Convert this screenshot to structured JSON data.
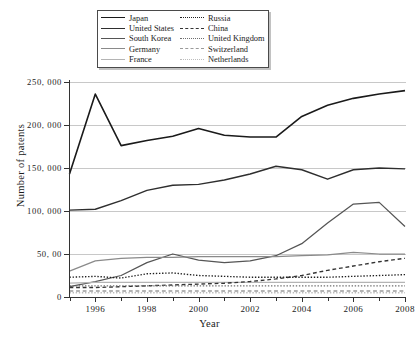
{
  "axes": {
    "ylabel": "Number of patents",
    "xlabel": "Year",
    "ytick_labels": [
      "0",
      "50, 00",
      "100, 000",
      "150, 000",
      "200, 000",
      "250, 000"
    ],
    "xtick_labels": [
      "1996",
      "1998",
      "2000",
      "2002",
      "2004",
      "2006",
      "2008"
    ]
  },
  "legend": {
    "left_column": [
      {
        "label": "Japan",
        "style": "solid",
        "color": "#1a1a1a",
        "width": 1.5
      },
      {
        "label": "United States",
        "style": "solid",
        "color": "#2e2e2e",
        "width": 1.3
      },
      {
        "label": "South Korea",
        "style": "solid",
        "color": "#555555",
        "width": 1.2
      },
      {
        "label": "Germany",
        "style": "solid",
        "color": "#8a8a8a",
        "width": 1.2
      },
      {
        "label": "France",
        "style": "solid",
        "color": "#b4b4b4",
        "width": 1.2
      }
    ],
    "right_column": [
      {
        "label": "Russia",
        "style": "dotted",
        "color": "#1f1f1f",
        "width": 1.4
      },
      {
        "label": "China",
        "style": "dashed",
        "color": "#333333",
        "width": 1.4
      },
      {
        "label": "United Kingdom",
        "style": "dotted",
        "color": "#6e6e6e",
        "width": 1.2
      },
      {
        "label": "Switzerland",
        "style": "dashed",
        "color": "#9a9a9a",
        "width": 1.2
      },
      {
        "label": "Netherlands",
        "style": "dotted",
        "color": "#bdbdbd",
        "width": 1.2
      }
    ]
  },
  "chart_data": {
    "type": "line",
    "title": "",
    "xlabel": "Year",
    "ylabel": "Number of patents",
    "xlim": [
      1995,
      2008
    ],
    "ylim": [
      0,
      250000
    ],
    "grid": true,
    "legend_position": "top-center",
    "x": [
      1995,
      1996,
      1997,
      1998,
      1999,
      2000,
      2001,
      2002,
      2003,
      2004,
      2005,
      2006,
      2007,
      2008
    ],
    "series": [
      {
        "name": "Japan",
        "style": "solid",
        "color": "#1a1a1a",
        "values": [
          143000,
          236000,
          176000,
          182000,
          187000,
          196000,
          188000,
          186000,
          186000,
          210000,
          223000,
          231000,
          236000,
          240000
        ]
      },
      {
        "name": "United States",
        "style": "solid",
        "color": "#2e2e2e",
        "values": [
          101000,
          102000,
          112000,
          124000,
          130000,
          131000,
          136000,
          143000,
          152000,
          148000,
          137000,
          148000,
          150000,
          149000
        ]
      },
      {
        "name": "South Korea",
        "style": "solid",
        "color": "#555555",
        "values": [
          12000,
          18000,
          25000,
          40000,
          50000,
          43000,
          40000,
          42000,
          48000,
          62000,
          86000,
          108000,
          110000,
          82000
        ]
      },
      {
        "name": "Germany",
        "style": "solid",
        "color": "#8a8a8a",
        "values": [
          30000,
          42000,
          45000,
          46000,
          46000,
          47000,
          47000,
          47000,
          47000,
          48000,
          49000,
          52000,
          50000,
          50000
        ]
      },
      {
        "name": "France",
        "style": "solid",
        "color": "#b4b4b4",
        "values": [
          16000,
          17000,
          17000,
          17000,
          17000,
          17000,
          17000,
          17000,
          17000,
          17000,
          17000,
          17000,
          17000,
          17000
        ]
      },
      {
        "name": "Russia",
        "style": "dotted",
        "color": "#1f1f1f",
        "values": [
          23000,
          24000,
          22000,
          27000,
          28000,
          25000,
          24000,
          23000,
          23000,
          23000,
          23000,
          24000,
          25000,
          26000
        ]
      },
      {
        "name": "China",
        "style": "dashed",
        "color": "#333333",
        "values": [
          11000,
          11000,
          12000,
          13000,
          14000,
          15000,
          16000,
          18000,
          21000,
          25000,
          31000,
          36000,
          41000,
          45000
        ]
      },
      {
        "name": "United Kingdom",
        "style": "dotted",
        "color": "#6e6e6e",
        "values": [
          13000,
          13000,
          13000,
          13000,
          13000,
          13000,
          13000,
          13000,
          13000,
          13000,
          13000,
          13000,
          13000,
          13000
        ]
      },
      {
        "name": "Switzerland",
        "style": "dashed",
        "color": "#9a9a9a",
        "values": [
          7000,
          7000,
          7000,
          7000,
          7000,
          7000,
          7000,
          7000,
          7000,
          7000,
          7000,
          7000,
          7000,
          7000
        ]
      },
      {
        "name": "Netherlands",
        "style": "dotted",
        "color": "#bdbdbd",
        "values": [
          5000,
          5000,
          5000,
          5000,
          5000,
          5000,
          5000,
          5000,
          5000,
          5000,
          5000,
          5000,
          5000,
          5000
        ]
      }
    ]
  }
}
